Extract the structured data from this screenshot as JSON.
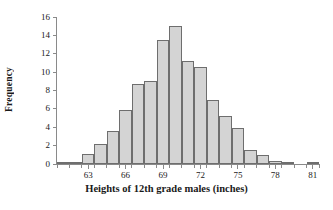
{
  "chart_data": {
    "type": "bar",
    "title": "",
    "xlabel": "Heights of 12th grade males (inches)",
    "ylabel": "Frequency",
    "xlim": [
      60.5,
      81.5
    ],
    "ylim": [
      0,
      16
    ],
    "bin_width": 1,
    "grid": false,
    "legend": null,
    "xticks": [
      63,
      66,
      69,
      72,
      75,
      78,
      81
    ],
    "yticks": [
      0,
      2,
      4,
      6,
      8,
      10,
      12,
      14,
      16
    ],
    "bar_color": "#d4d4d4",
    "bar_edge_color": "#6e6e6e",
    "categories": [
      61,
      62,
      63,
      64,
      65,
      66,
      67,
      68,
      69,
      70,
      71,
      72,
      73,
      74,
      75,
      76,
      77,
      78,
      79,
      80,
      81
    ],
    "values": [
      0.2,
      0.2,
      1.1,
      2.15,
      3.6,
      5.85,
      8.7,
      9.0,
      13.5,
      15.0,
      11.2,
      10.6,
      6.95,
      5.2,
      3.9,
      1.5,
      1.0,
      0.3,
      0.1,
      0,
      0.15
    ]
  }
}
